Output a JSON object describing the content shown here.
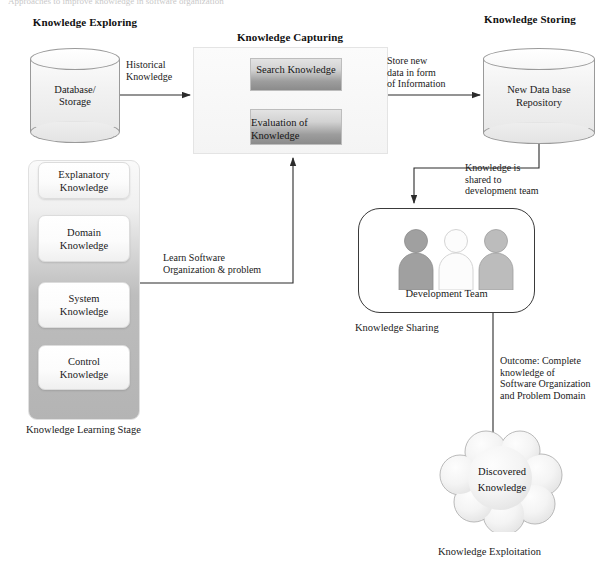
{
  "diagram": {
    "title_cut_top": "Approaches to improve knowledge in software organization",
    "sections": {
      "exploring": "Knowledge Exploring",
      "capturing": "Knowledge Capturing",
      "storing": "Knowledge Storing"
    },
    "nodes": {
      "database_storage": "Database/ Storage",
      "database_storage_l1": "Database/",
      "database_storage_l2": "Storage",
      "search_knowledge": "Search Knowledge",
      "evaluation_of_knowledge_l1": "Evaluation of",
      "evaluation_of_knowledge_l2": "Knowledge",
      "new_database_repository_l1": "New Data base",
      "new_database_repository_l2": "Repository",
      "development_team": "Development Team",
      "discovered_knowledge_l1": "Discovered",
      "discovered_knowledge_l2": "Knowledge"
    },
    "stack": {
      "caption": "Knowledge Learning Stage",
      "items": [
        {
          "line1": "Explanatory",
          "line2": "Knowledge"
        },
        {
          "line1": "Domain",
          "line2": "Knowledge"
        },
        {
          "line1": "System",
          "line2": "Knowledge"
        },
        {
          "line1": "Control",
          "line2": "Knowledge"
        }
      ]
    },
    "captions": {
      "knowledge_sharing": "Knowledge Sharing",
      "knowledge_exploitation": "Knowledge Exploitation"
    },
    "edges": {
      "historical_knowledge": {
        "line1": "Historical",
        "line2": "Knowledge"
      },
      "store_new_data": {
        "line1": "Store new",
        "line2": "data in form",
        "line3": "of Information"
      },
      "knowledge_shared": {
        "line1": "Knowledge is",
        "line2": "shared to",
        "line3": "development team"
      },
      "learn_software": {
        "line1": "Learn Software",
        "line2": "Organization & problem"
      },
      "outcome": {
        "line1": "Outcome: Complete",
        "line2": "knowledge of",
        "line3": "Software Organization",
        "line4": "and Problem Domain"
      }
    },
    "colors": {
      "background": "#ffffff",
      "line": "#2b2b2b",
      "box_gradient_top": "#e3e3e3",
      "box_gradient_bottom": "#8b8b8b",
      "stack_gradient_top": "#fafafa",
      "stack_gradient_bottom": "#b4b4b4",
      "person_dark": "#9a9a9a",
      "person_light": "#fbfbfb",
      "person_mid": "#b3b3b3",
      "cloud_fill": "#f3f3f3"
    }
  }
}
